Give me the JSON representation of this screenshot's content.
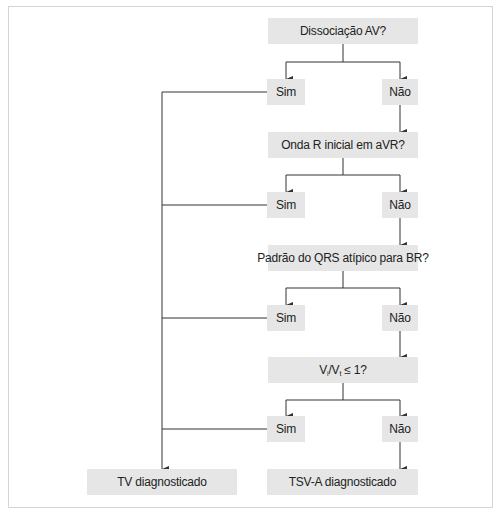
{
  "diagram": {
    "type": "flowchart",
    "colors": {
      "box_fill": "#e6e6e6",
      "line": "#333333",
      "frame": "#d4d4d4",
      "text": "#222222"
    },
    "nodes": {
      "q1": "Dissociação AV?",
      "q2": "Onda R inicial em aVR?",
      "q3": "Padrão do QRS atípico para BR?",
      "q4": {
        "v1": "V",
        "s1": "i",
        "sep": "/V",
        "s2": "t",
        "rest": " ≤ 1?"
      },
      "yes_label": "Sim",
      "no_label": "Não",
      "result_tv": "TV diagnosticado",
      "result_tsv": "TSV-A diagnosticado"
    },
    "edges": [
      {
        "from": "q1",
        "to": "q1-sim"
      },
      {
        "from": "q1",
        "to": "q1-nao"
      },
      {
        "from": "q1-nao",
        "to": "q2"
      },
      {
        "from": "q2",
        "to": "q2-sim"
      },
      {
        "from": "q2",
        "to": "q2-nao"
      },
      {
        "from": "q2-nao",
        "to": "q3"
      },
      {
        "from": "q3",
        "to": "q3-sim"
      },
      {
        "from": "q3",
        "to": "q3-nao"
      },
      {
        "from": "q3-nao",
        "to": "q4"
      },
      {
        "from": "q4",
        "to": "q4-sim"
      },
      {
        "from": "q4",
        "to": "q4-nao"
      },
      {
        "from": "q4-nao",
        "to": "result_tsv"
      },
      {
        "from": "q1-sim",
        "to": "result_tv"
      },
      {
        "from": "q2-sim",
        "to": "result_tv"
      },
      {
        "from": "q3-sim",
        "to": "result_tv"
      },
      {
        "from": "q4-sim",
        "to": "result_tv"
      }
    ]
  }
}
